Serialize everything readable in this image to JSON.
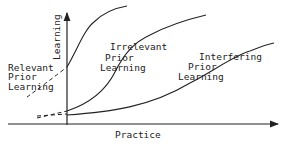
{
  "diagram": {
    "axes": {
      "y_label": "Learning",
      "x_label": "Practice"
    },
    "curves": [
      {
        "id": "relevant",
        "label_lines": [
          "Relevant",
          "Prior",
          "Learning"
        ]
      },
      {
        "id": "irrelevant",
        "label_lines": [
          "Irrelevant",
          "Prior",
          "Learning"
        ]
      },
      {
        "id": "interfering",
        "label_lines": [
          "Interfering",
          "Prior",
          "Learning"
        ]
      }
    ],
    "colors": {
      "line": "#222222",
      "background": "#ffffff"
    }
  }
}
